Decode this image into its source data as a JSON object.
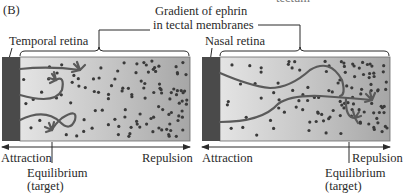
{
  "panel_label": "(B)",
  "top_cut_text": "tectum",
  "gradient_label": {
    "line1": "Gradient of ephrin",
    "line2": "in tectal membranes"
  },
  "panels": [
    {
      "id": "temporal",
      "retina_label": "Temporal retina",
      "axis_left": "Attraction",
      "axis_right": "Repulsion",
      "equilibrium_line1": "Equilibrium",
      "equilibrium_line2": "(target)",
      "equilibrium_x_fraction": 0.27
    },
    {
      "id": "nasal",
      "retina_label": "Nasal retina",
      "axis_left": "Attraction",
      "axis_right": "Repulsion",
      "equilibrium_line1": "Equilibrium",
      "equilibrium_line2": "(target)",
      "equilibrium_x_fraction": 0.86
    }
  ],
  "colors": {
    "retina_bar": "#4a4a4a",
    "gradient_light": "#e2e2e2",
    "gradient_dark": "#a9a9a9",
    "axon": "#585858",
    "dot": "#3a3a3a",
    "line": "#2a2a2a"
  }
}
